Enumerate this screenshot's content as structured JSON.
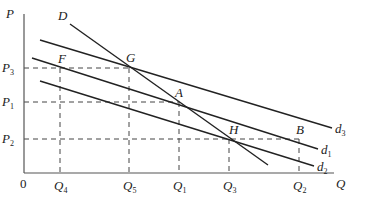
{
  "axes": {
    "y_label": "P",
    "x_label": "Q",
    "origin_label": "0"
  },
  "price_levels": [
    {
      "name": "P",
      "sub": "3",
      "y": 68
    },
    {
      "name": "P",
      "sub": "1",
      "y": 102
    },
    {
      "name": "P",
      "sub": "2",
      "y": 139
    }
  ],
  "quantity_levels": [
    {
      "name": "Q",
      "sub": "4",
      "x": 60
    },
    {
      "name": "Q",
      "sub": "5",
      "x": 129
    },
    {
      "name": "Q",
      "sub": "1",
      "x": 179
    },
    {
      "name": "Q",
      "sub": "3",
      "x": 229
    },
    {
      "name": "Q",
      "sub": "2",
      "x": 299
    }
  ],
  "curves": [
    {
      "id": "D",
      "label": "D",
      "sub": "",
      "x1": 70,
      "y1": 24,
      "x2": 268,
      "y2": 165,
      "label_pos": "start"
    },
    {
      "id": "d3",
      "label": "d",
      "sub": "3",
      "x1": 40,
      "y1": 40,
      "x2": 332,
      "y2": 128,
      "label_pos": "end"
    },
    {
      "id": "d1",
      "label": "d",
      "sub": "1",
      "x1": 32,
      "y1": 58,
      "x2": 318,
      "y2": 149,
      "label_pos": "end"
    },
    {
      "id": "d2",
      "label": "d",
      "sub": "2",
      "x1": 40,
      "y1": 81,
      "x2": 314,
      "y2": 166,
      "label_pos": "end"
    }
  ],
  "points": [
    {
      "label": "F",
      "x": 60,
      "y": 68,
      "lx": 58,
      "ly": 63
    },
    {
      "label": "G",
      "x": 129,
      "y": 68,
      "lx": 126,
      "ly": 62
    },
    {
      "label": "A",
      "x": 179,
      "y": 102,
      "lx": 175,
      "ly": 97
    },
    {
      "label": "H",
      "x": 229,
      "y": 139,
      "lx": 229,
      "ly": 134
    },
    {
      "label": "B",
      "x": 299,
      "y": 139,
      "lx": 296,
      "ly": 134
    }
  ],
  "guides": {
    "horizontal": [
      {
        "y": 68,
        "x_end": 129
      },
      {
        "y": 102,
        "x_end": 179
      },
      {
        "y": 139,
        "x_end": 299
      }
    ],
    "vertical": [
      {
        "x": 60,
        "y_start": 68
      },
      {
        "x": 129,
        "y_start": 68
      },
      {
        "x": 179,
        "y_start": 102
      },
      {
        "x": 229,
        "y_start": 139
      },
      {
        "x": 299,
        "y_start": 139
      }
    ]
  }
}
